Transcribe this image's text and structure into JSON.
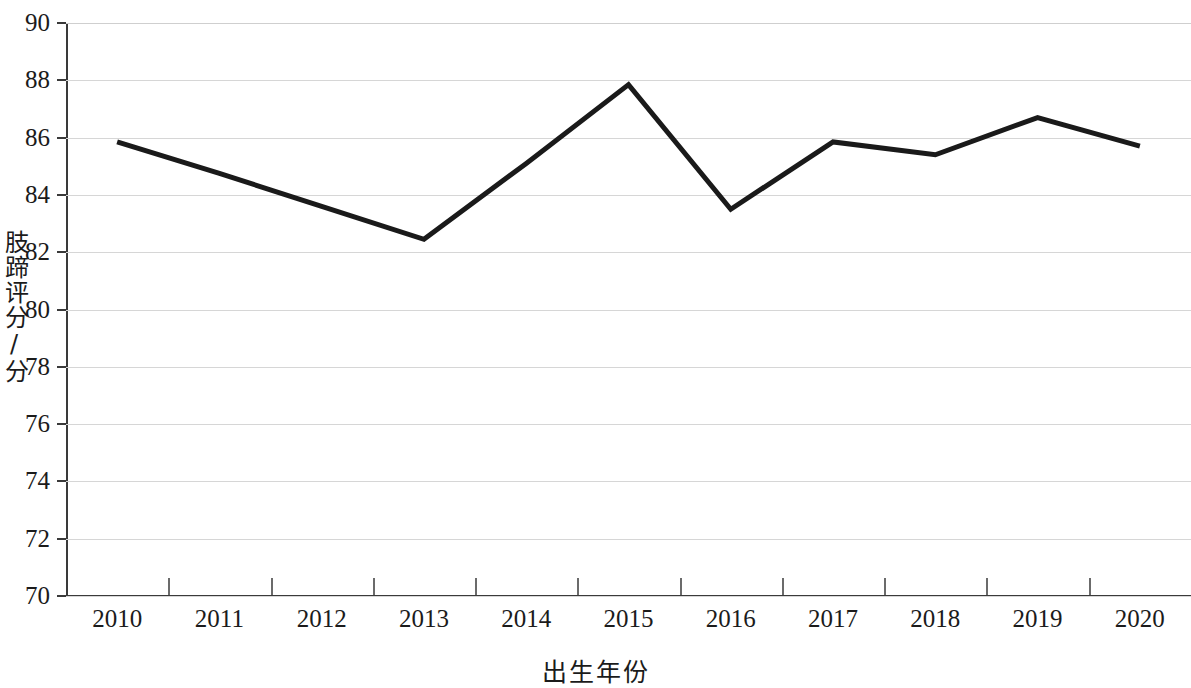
{
  "chart_data": {
    "type": "line",
    "title": "",
    "xlabel": "出生年份",
    "ylabel": "肢蹄评分/分",
    "categories": [
      "2010",
      "2011",
      "2012",
      "2013",
      "2014",
      "2015",
      "2016",
      "2017",
      "2018",
      "2019",
      "2020"
    ],
    "values": [
      85.85,
      84.75,
      83.6,
      82.45,
      85.1,
      87.85,
      83.5,
      85.85,
      85.4,
      86.7,
      85.7
    ],
    "series": [
      {
        "name": "肢蹄评分",
        "values": [
          85.85,
          84.75,
          83.6,
          82.45,
          85.1,
          87.85,
          83.5,
          85.85,
          85.4,
          86.7,
          85.7
        ]
      }
    ],
    "ylim": [
      70,
      90
    ],
    "yticks": [
      "90",
      "88",
      "86",
      "84",
      "82",
      "80",
      "78",
      "76",
      "74",
      "72",
      "70"
    ],
    "ytick_values": [
      90,
      88,
      86,
      84,
      82,
      80,
      78,
      76,
      74,
      72,
      70
    ],
    "ytick_step": 2,
    "grid": true,
    "grid_axis": "y",
    "legend": "none",
    "line_color": "#1a1a1a",
    "line_width": 5,
    "grid_color": "#d6d6d6",
    "axis_color": "#3a3a3a",
    "background_color": "#ffffff",
    "markers": "none"
  }
}
